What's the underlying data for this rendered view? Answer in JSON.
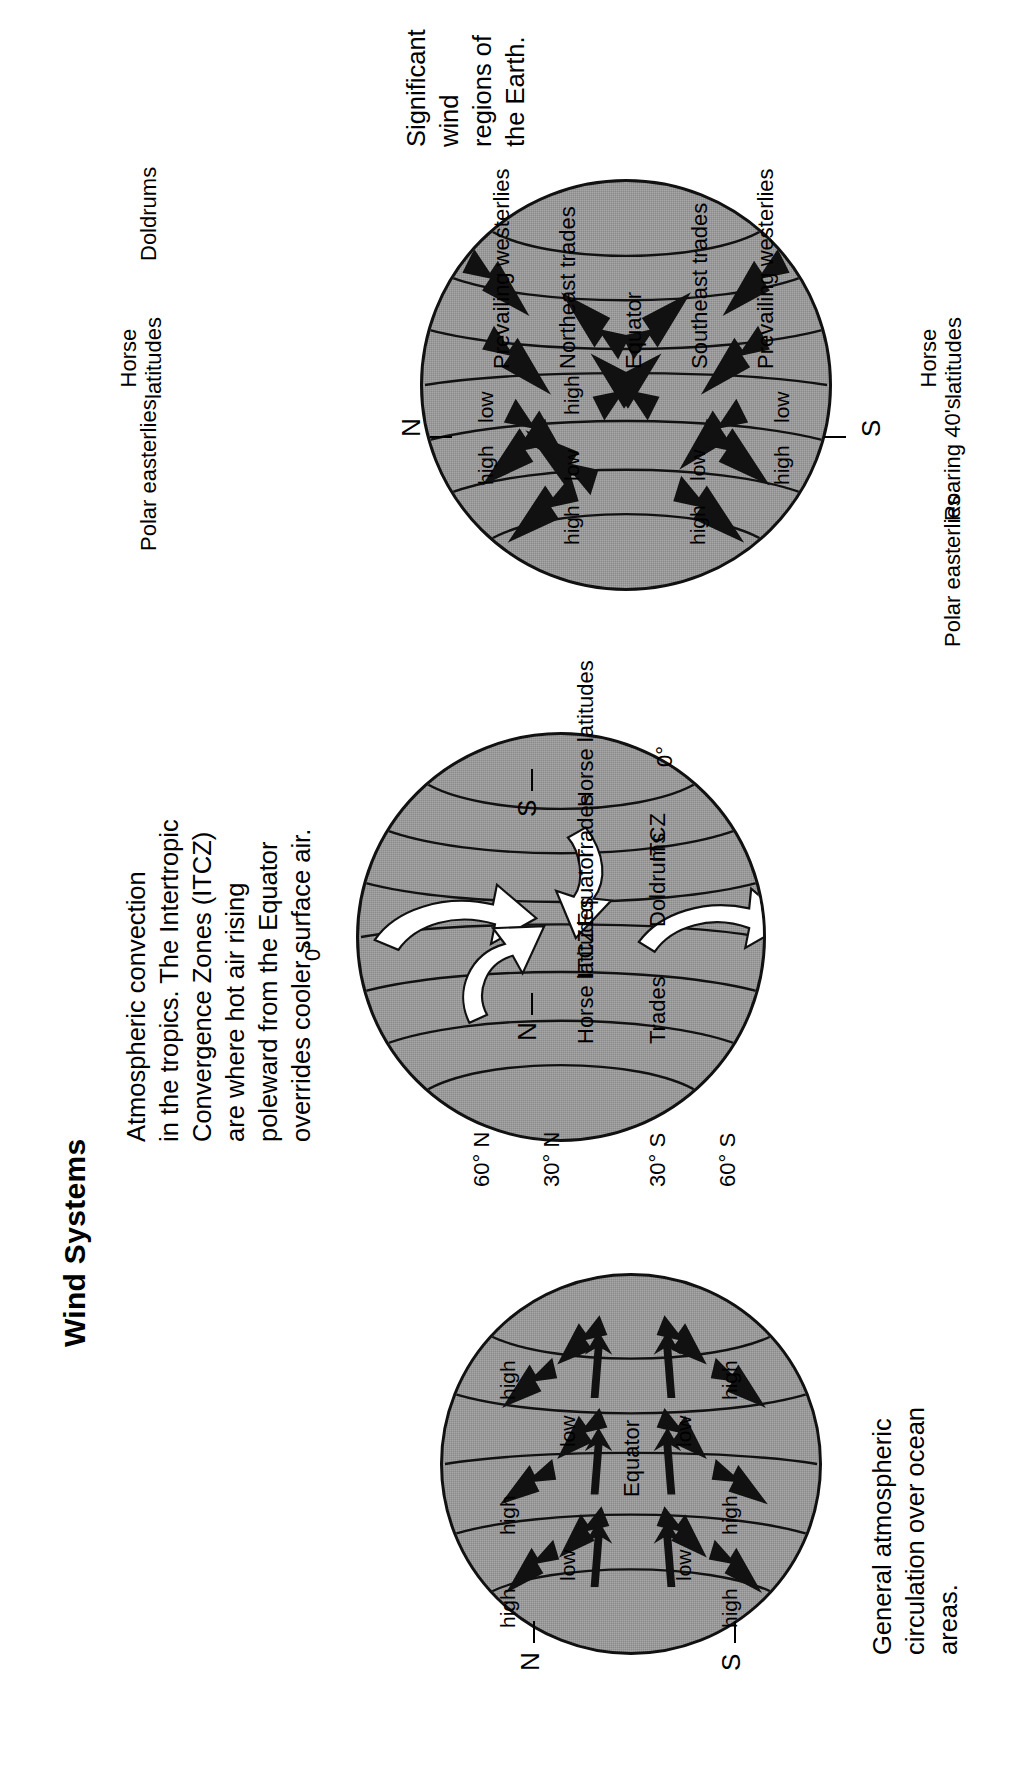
{
  "page": {
    "title": "Wind Systems",
    "background_color": "#ffffff",
    "globe_fill_color": "#9a9a9a",
    "ink_color": "#000000"
  },
  "figures": [
    {
      "id": "left-globe",
      "caption": "General atmospheric\ncirculation over ocean\nareas.",
      "pole_north": "N",
      "pole_south": "S",
      "equator_label": "Equator",
      "pressure_labels": [
        "high",
        "low",
        "high",
        "low",
        "high",
        "low",
        "high"
      ],
      "band_labels_north": [
        "high",
        "low",
        "high"
      ],
      "band_labels_south": [
        "high",
        "low",
        "high"
      ]
    },
    {
      "id": "middle-globe",
      "caption": "Atmospheric convection\nin the tropics. The Intertropic\nConvergence Zones (ITCZ)\nare where hot air rising\npoleward from the Equator\noverrides cooler surface air.",
      "pole_north": "N",
      "pole_south": "S",
      "latitude_labels": [
        "60° N",
        "30° N",
        "30° S",
        "60° S"
      ],
      "zone_labels": [
        "Horse latitudes",
        "Trades",
        "ITCZ",
        "Equator",
        "Doldrums",
        "ITCZ",
        "Trades",
        "Horse latitudes"
      ],
      "arrow_labels": [
        "0°",
        "0°"
      ]
    },
    {
      "id": "right-globe",
      "caption": "Significant wind\nregions of the Earth.",
      "pole_north": "N",
      "pole_south": "S",
      "outer_labels_top": [
        "Polar easterlies",
        "Horse\nlatitudes",
        "Doldrums"
      ],
      "outer_labels_bottom": [
        "Horse\nlatitudes",
        "Roaring 40's",
        "Polar easterlies"
      ],
      "inner_labels": [
        "high",
        "low",
        "Prevailing westerlies",
        "Northeast trades",
        "Equator",
        "Southeast trades",
        "Prevailing westerlies",
        "high",
        "low",
        "high",
        "low",
        "high"
      ],
      "band_labels": [
        "high",
        "low",
        "high",
        "low",
        "high",
        "low",
        "high"
      ]
    }
  ]
}
